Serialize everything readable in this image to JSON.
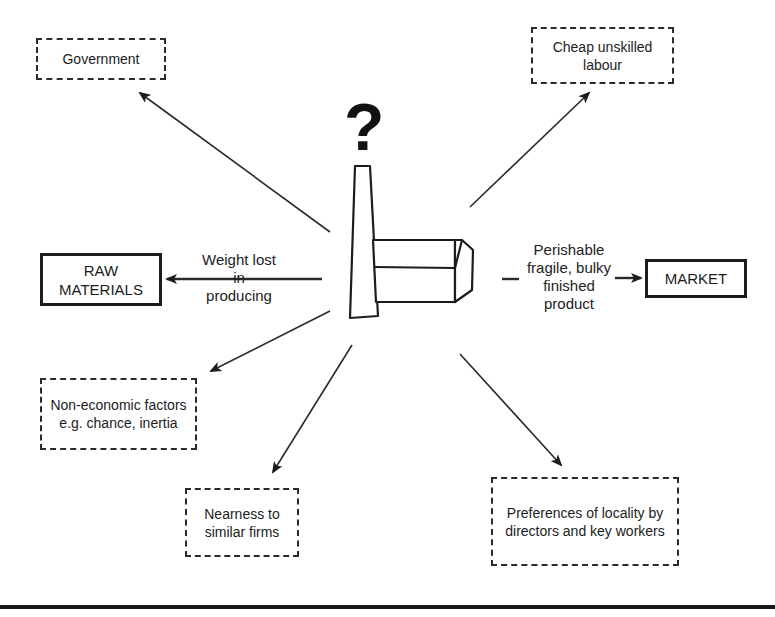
{
  "diagram": {
    "center": {
      "symbol": "?",
      "icon": "factory-icon"
    },
    "boxes": {
      "government": {
        "label": "Government",
        "style": "dashed"
      },
      "labour": {
        "label": "Cheap unskilled labour",
        "style": "dashed"
      },
      "raw_materials": {
        "label": "RAW MATERIALS",
        "style": "solid"
      },
      "market": {
        "label": "MARKET",
        "style": "solid"
      },
      "non_economic": {
        "label": "Non-economic factors e.g. chance, inertia",
        "style": "dashed"
      },
      "nearness": {
        "label": "Nearness to similar firms",
        "style": "dashed"
      },
      "preferences": {
        "label": "Preferences of locality by directors and key workers",
        "style": "dashed"
      }
    },
    "edge_labels": {
      "raw_materials": "Weight lost in producing",
      "market": "Perishable fragile, bulky finished product"
    },
    "colors": {
      "ink": "#1c1c1c",
      "background": "#ffffff"
    }
  }
}
